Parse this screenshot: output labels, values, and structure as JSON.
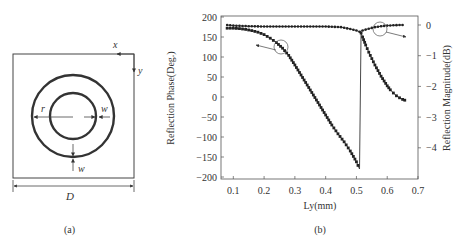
{
  "panel_a": {
    "caption": "(a)",
    "labels": {
      "x": "x",
      "y": "y",
      "r": "r",
      "w_right": "w",
      "w_bottom": "w",
      "D": "D"
    }
  },
  "panel_b": {
    "caption": "(b)"
  },
  "chart_data": {
    "type": "line",
    "title": "",
    "xlabel": "Ly(mm)",
    "ylabel": "Reflection Phase(Deg.)",
    "y2label": "Reflection Magnitude(dB)",
    "xlim": [
      0.06,
      0.7
    ],
    "ylim": [
      -200,
      200
    ],
    "y2lim": [
      -5.0,
      0.25
    ],
    "xticks": [
      "0.1",
      "0.2",
      "0.3",
      "0.4",
      "0.5",
      "0.6",
      "0.7"
    ],
    "yticks": [
      "200",
      "150",
      "100",
      "50",
      "0",
      "-50",
      "-100",
      "-150",
      "-200"
    ],
    "y2ticks": [
      "0",
      "-1",
      "-2",
      "-3",
      "-4"
    ],
    "grid": false,
    "annotations": [
      {
        "text": "circle + arrow pointing left to phase curve (left axis)",
        "x": 0.26,
        "y": 125
      },
      {
        "text": "circle + arrow pointing right to magnitude curve (right axis)",
        "x": 0.575,
        "y": -0.05
      }
    ],
    "series": [
      {
        "name": "Reflection Phase",
        "axis": "left",
        "marker": "square",
        "x": [
          0.08,
          0.1,
          0.12,
          0.14,
          0.16,
          0.18,
          0.2,
          0.22,
          0.24,
          0.26,
          0.28,
          0.3,
          0.32,
          0.34,
          0.36,
          0.38,
          0.4,
          0.42,
          0.44,
          0.46,
          0.48,
          0.5,
          0.51,
          0.515,
          0.52,
          0.53,
          0.54,
          0.55,
          0.56,
          0.57,
          0.58,
          0.59,
          0.6,
          0.61,
          0.62,
          0.63,
          0.64,
          0.65,
          0.657
        ],
        "values": [
          172,
          172,
          171,
          169,
          166,
          162,
          156,
          147,
          136,
          122,
          104,
          80,
          55,
          30,
          5,
          -20,
          -45,
          -70,
          -92,
          -112,
          -135,
          -162,
          -180,
          160,
          150,
          130,
          112,
          96,
          80,
          66,
          52,
          40,
          28,
          18,
          10,
          3,
          -2,
          -6,
          -8
        ]
      },
      {
        "name": "Reflection Magnitude",
        "axis": "right",
        "marker": "diamond",
        "x": [
          0.08,
          0.1,
          0.15,
          0.2,
          0.25,
          0.3,
          0.35,
          0.4,
          0.45,
          0.48,
          0.5,
          0.51,
          0.52,
          0.54,
          0.56,
          0.58,
          0.6,
          0.62,
          0.64,
          0.65
        ],
        "values": [
          0.0,
          -0.02,
          -0.04,
          -0.05,
          -0.05,
          -0.05,
          -0.05,
          -0.05,
          -0.07,
          -0.13,
          -0.18,
          -0.22,
          -0.18,
          -0.12,
          -0.07,
          -0.04,
          -0.02,
          -0.01,
          0.0,
          0.0
        ]
      }
    ]
  }
}
